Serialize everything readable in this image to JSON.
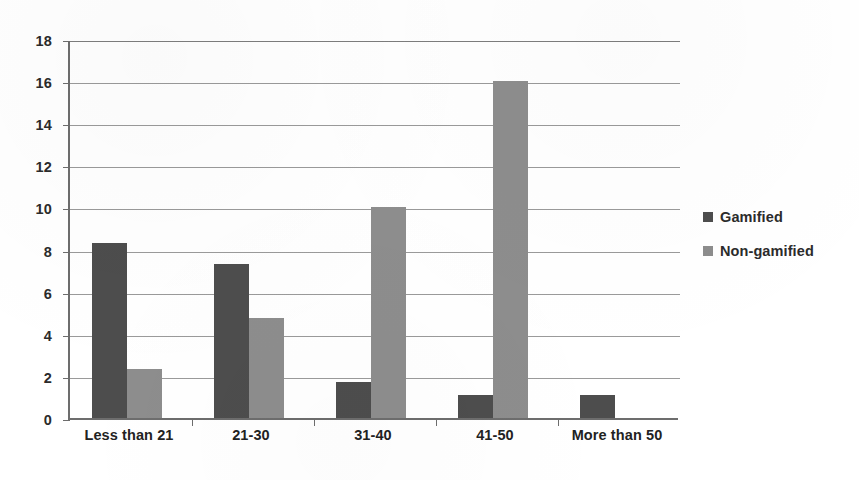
{
  "chart_data": {
    "type": "bar",
    "title": "",
    "subtitle": "",
    "xlabel": "",
    "ylabel": "",
    "categories": [
      "Less than 21",
      "21-30",
      "31-40",
      "41-50",
      "More than 50"
    ],
    "series": [
      {
        "name": "Gamified",
        "color": "#4d4d4d",
        "values": [
          8.3,
          7.3,
          1.7,
          1.1,
          1.1
        ]
      },
      {
        "name": "Non-gamified",
        "color": "#8d8d8d",
        "values": [
          2.35,
          4.75,
          10,
          16,
          0
        ]
      }
    ],
    "ylim": [
      0,
      18
    ],
    "ytick_labels": [
      "0",
      "2",
      "4",
      "6",
      "8",
      "10",
      "12",
      "14",
      "16",
      "18"
    ],
    "ytick_values": [
      0,
      2,
      4,
      6,
      8,
      10,
      12,
      14,
      16,
      18
    ],
    "ytick_step": 2,
    "grid": true,
    "grid_axis": "y",
    "legend_position": "right",
    "legend": [
      {
        "label": "Gamified",
        "color": "#4d4d4d"
      },
      {
        "label": "Non-gamified",
        "color": "#8d8d8d"
      }
    ],
    "axis_color": "#6d6d6d",
    "grid_color": "#9a9a9a",
    "background": "#ffffff"
  }
}
